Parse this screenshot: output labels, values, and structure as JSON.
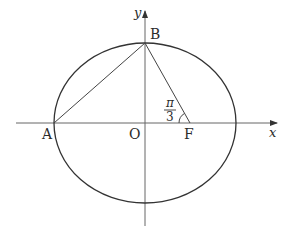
{
  "diagram": {
    "type": "ellipse-coordinate-figure",
    "colors": {
      "stroke": "#333333",
      "axis": "#555555",
      "text": "#2b2b2b",
      "background": "#ffffff"
    },
    "axes": {
      "x_label": "x",
      "y_label": "y"
    },
    "points": {
      "A": {
        "label": "A"
      },
      "B": {
        "label": "B"
      },
      "O": {
        "label": "O"
      },
      "F": {
        "label": "F"
      }
    },
    "angle": {
      "at": "F",
      "numerator": "π",
      "denominator": "3",
      "description": "angle BFO = π/3"
    },
    "segments": [
      "AB",
      "BF"
    ]
  }
}
